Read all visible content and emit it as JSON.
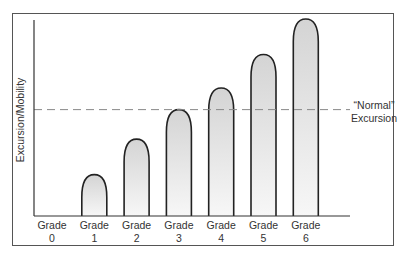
{
  "chart_data": {
    "type": "bar",
    "title": "",
    "xlabel": "",
    "ylabel": "Excursion/Mobility",
    "categories": [
      "Grade 0",
      "Grade 1",
      "Grade 2",
      "Grade 3",
      "Grade 4",
      "Grade 5",
      "Grade 6"
    ],
    "category_lines": [
      [
        "Grade",
        "0"
      ],
      [
        "Grade",
        "1"
      ],
      [
        "Grade",
        "2"
      ],
      [
        "Grade",
        "3"
      ],
      [
        "Grade",
        "4"
      ],
      [
        "Grade",
        "5"
      ],
      [
        "Grade",
        "6"
      ]
    ],
    "values": [
      0,
      21,
      39,
      54,
      65,
      82,
      100
    ],
    "ylim": [
      0,
      100
    ],
    "y_ticks_shown": false,
    "grid": false,
    "bar_shape": "rounded-top (bullet)",
    "bar_fill": "gradient light gray to white",
    "reference_line": {
      "value": 54,
      "style": "dashed",
      "label_lines": [
        "“Normal”",
        "Excursion"
      ]
    },
    "legend": null
  },
  "colors": {
    "bar_stroke": "#222222",
    "bar_fill_top": "#d4d4d4",
    "bar_fill_bottom": "#f7f7f7",
    "dashed_line": "#888888",
    "axis": "#333333",
    "frame": "#555555"
  }
}
